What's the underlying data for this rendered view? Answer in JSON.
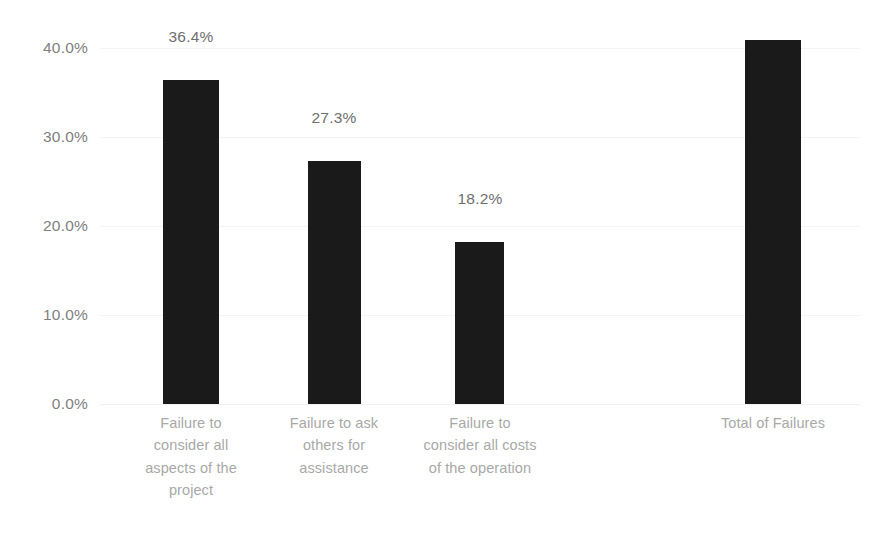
{
  "chart_data": {
    "type": "bar",
    "title": "",
    "subtitle": "",
    "xlabel": "",
    "ylabel": "",
    "ylim": [
      0,
      40
    ],
    "ytick_labels": [
      "0.0%",
      "10.0%",
      "20.0%",
      "30.0%",
      "40.0%"
    ],
    "ytick_values": [
      0,
      10,
      20,
      30,
      40
    ],
    "grid": true,
    "legend": false,
    "legend_position": "none",
    "bar_color": "#1a1a1a",
    "categories": [
      "Failure to consider all aspects of the project",
      "Failure to ask others for assistance",
      "Failure to consider all costs of the operation",
      "Total of Failures"
    ],
    "values": [
      36.4,
      27.3,
      18.2,
      40.9
    ],
    "data_labels": [
      "36.4%",
      "27.3%",
      "18.2%",
      ""
    ]
  },
  "axis": {
    "ticks": [
      {
        "label": "40.0%",
        "value": 40
      },
      {
        "label": "30.0%",
        "value": 30
      },
      {
        "label": "20.0%",
        "value": 20
      },
      {
        "label": "10.0%",
        "value": 10
      },
      {
        "label": "0.0%",
        "value": 0
      }
    ]
  },
  "bars": [
    {
      "value": 36.4,
      "data_label": "36.4%",
      "lines": [
        "Failure to",
        "consider all",
        "aspects of the",
        "project"
      ]
    },
    {
      "value": 27.3,
      "data_label": "27.3%",
      "lines": [
        "Failure to ask",
        "others for",
        "assistance"
      ]
    },
    {
      "value": 18.2,
      "data_label": "18.2%",
      "lines": [
        "Failure to",
        "consider all costs",
        "of the operation"
      ]
    },
    {
      "value": 40.9,
      "data_label": "",
      "lines": [
        "Total of Failures"
      ]
    }
  ],
  "colors": {
    "bar": "#1a1a1a",
    "axis_text": "#808080",
    "category_text": "#a8a8a8",
    "data_label_text": "#6e6e6e",
    "gridline": "#f4f4f4",
    "background": "#ffffff"
  }
}
